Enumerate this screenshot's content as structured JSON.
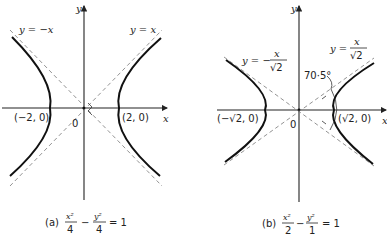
{
  "panel_a": {
    "x_axis_label": "x",
    "y_axis_label": "y",
    "origin_label": "0",
    "asymptote_pos_label": "y = x",
    "asymptote_neg_label": "y = −x",
    "vertex_left": "(−2, 0)",
    "vertex_right": "(2, 0)",
    "caption_prefix": "(a)",
    "caption_num1": "x²",
    "caption_den1": "4",
    "caption_minus": "−",
    "caption_num2": "y²",
    "caption_den2": "4",
    "caption_rhs": "= 1"
  },
  "panel_b": {
    "x_axis_label": "x",
    "y_axis_label": "y",
    "origin_label": "0",
    "asymptote_pos_prefix": "y =",
    "asymptote_pos_num": "x",
    "asymptote_pos_den": "√2",
    "asymptote_neg_prefix": "y = −",
    "asymptote_neg_num": "x",
    "asymptote_neg_den": "√2",
    "angle_label": "70·5°",
    "vertex_left": "(−√2, 0)",
    "vertex_right": "(√2, 0)",
    "caption_prefix": "(b)",
    "caption_num1": "x²",
    "caption_den1": "2",
    "caption_minus": "−",
    "caption_num2": "y²",
    "caption_den2": "1",
    "caption_rhs": "= 1"
  }
}
